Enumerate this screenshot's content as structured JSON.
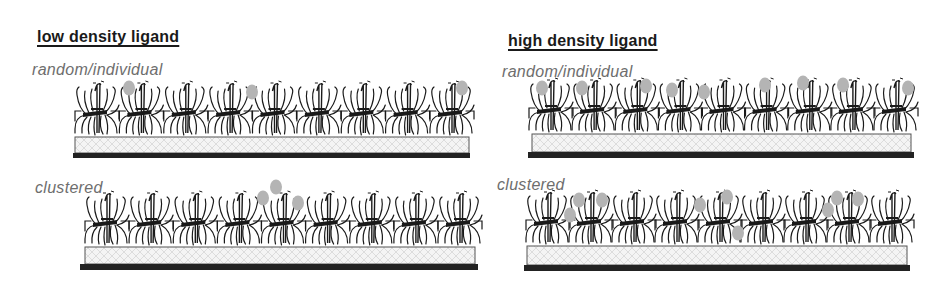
{
  "figure": {
    "columns": [
      {
        "heading": "low density ligand",
        "panels": [
          {
            "label": "random/individual",
            "receptor_count": 9,
            "ligands": [
              {
                "x": 129,
                "y": 88
              },
              {
                "x": 252,
                "y": 92
              },
              {
                "x": 462,
                "y": 88
              }
            ]
          },
          {
            "label": "clustered",
            "receptor_count": 9,
            "ligands": [
              {
                "x": 263,
                "y": 198
              },
              {
                "x": 276,
                "y": 187
              },
              {
                "x": 298,
                "y": 203
              }
            ]
          }
        ]
      },
      {
        "heading": "high density ligand",
        "panels": [
          {
            "label": "random/individual",
            "receptor_count": 9,
            "ligands": [
              {
                "x": 542,
                "y": 88
              },
              {
                "x": 582,
                "y": 88
              },
              {
                "x": 646,
                "y": 86
              },
              {
                "x": 672,
                "y": 90
              },
              {
                "x": 704,
                "y": 92
              },
              {
                "x": 765,
                "y": 85
              },
              {
                "x": 803,
                "y": 83
              },
              {
                "x": 843,
                "y": 85
              },
              {
                "x": 908,
                "y": 88
              }
            ]
          },
          {
            "label": "clustered",
            "receptor_count": 9,
            "ligands": [
              {
                "x": 570,
                "y": 215
              },
              {
                "x": 579,
                "y": 200
              },
              {
                "x": 602,
                "y": 200
              },
              {
                "x": 700,
                "y": 205
              },
              {
                "x": 727,
                "y": 197
              },
              {
                "x": 738,
                "y": 233
              },
              {
                "x": 828,
                "y": 210
              },
              {
                "x": 837,
                "y": 198
              },
              {
                "x": 858,
                "y": 199
              }
            ]
          }
        ]
      }
    ],
    "colors": {
      "ligand": "#b4b4b4",
      "receptor": "#1a1a1a",
      "substrate_fill": "#f4f4f4",
      "substrate_hatch": "#d6d6d6",
      "base_bar": "#222222",
      "heading_text": "#1a1a1a",
      "sublabel_text": "#6e6e6e"
    }
  }
}
